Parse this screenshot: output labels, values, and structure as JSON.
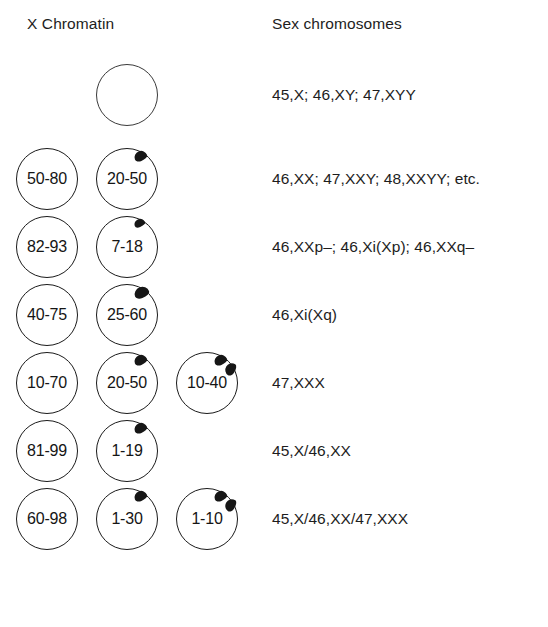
{
  "figure": {
    "title_left": "X Chromatin",
    "title_right": "Sex chromosomes"
  },
  "rows": [
    {
      "id": "row-1",
      "cells": [
        {
          "label": "",
          "barr_bodies": 0,
          "outline": "thin",
          "column": 1,
          "empty": true
        }
      ],
      "karyotype": "45,X; 46,XY; 47,XYY"
    },
    {
      "id": "row-2",
      "cells": [
        {
          "label": "50-80",
          "barr_bodies": 0,
          "outline": "normal",
          "column": 0
        },
        {
          "label": "20-50",
          "barr_bodies": 1,
          "outline": "normal",
          "column": 1
        }
      ],
      "karyotype": "46,XX; 47,XXY; 48,XXYY; etc."
    },
    {
      "id": "row-3",
      "cells": [
        {
          "label": "82-93",
          "barr_bodies": 0,
          "outline": "normal",
          "column": 0
        },
        {
          "label": "7-18",
          "barr_bodies": 1,
          "outline": "normal",
          "column": 1,
          "barr_size": "small"
        }
      ],
      "karyotype": "46,XXp–; 46,Xi(Xp); 46,XXq–"
    },
    {
      "id": "row-4",
      "cells": [
        {
          "label": "40-75",
          "barr_bodies": 0,
          "outline": "normal",
          "column": 0
        },
        {
          "label": "25-60",
          "barr_bodies": 1,
          "outline": "normal",
          "column": 1,
          "barr_size": "large"
        }
      ],
      "karyotype": "46,Xi(Xq)"
    },
    {
      "id": "row-5",
      "cells": [
        {
          "label": "10-70",
          "barr_bodies": 0,
          "outline": "normal",
          "column": 0
        },
        {
          "label": "20-50",
          "barr_bodies": 1,
          "outline": "normal",
          "column": 1
        },
        {
          "label": "10-40",
          "barr_bodies": 2,
          "outline": "normal",
          "column": 2
        }
      ],
      "karyotype": "47,XXX"
    },
    {
      "id": "row-6",
      "cells": [
        {
          "label": "81-99",
          "barr_bodies": 0,
          "outline": "normal",
          "column": 0
        },
        {
          "label": "1-19",
          "barr_bodies": 1,
          "outline": "normal",
          "column": 1
        }
      ],
      "karyotype": "45,X/46,XX"
    },
    {
      "id": "row-7",
      "cells": [
        {
          "label": "60-98",
          "barr_bodies": 0,
          "outline": "normal",
          "column": 0
        },
        {
          "label": "1-30",
          "barr_bodies": 1,
          "outline": "normal",
          "column": 1
        },
        {
          "label": "1-10",
          "barr_bodies": 2,
          "outline": "normal",
          "column": 2
        }
      ],
      "karyotype": "45,X/46,XX/47,XXX"
    }
  ],
  "layout": {
    "row_tops": [
      62,
      146,
      214,
      282,
      350,
      418,
      486
    ],
    "row_top_first": 62,
    "row_pitch": 68
  },
  "colors": {
    "background": "#ffffff",
    "outline": "#1a1a1a",
    "barr_body": "#161616",
    "text": "#1d1d1d"
  }
}
